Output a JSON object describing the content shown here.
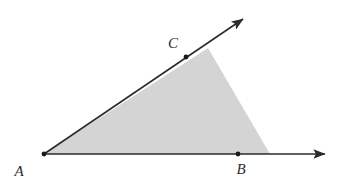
{
  "figure": {
    "canvas": {
      "width": 342,
      "height": 186,
      "background": "#ffffff"
    },
    "style": {
      "stroke_color": "#2b2b2b",
      "stroke_width": 1.6,
      "shade_color": "#d4d4d4",
      "point_color": "#1a1a1a",
      "point_radius": 2.4,
      "label_color": "#2b2b2b",
      "label_font_size": 15
    },
    "labels": {
      "A": "A",
      "B": "B",
      "C": "C"
    },
    "points": [
      {
        "name": "A",
        "label": "A",
        "x": 44,
        "y": 154,
        "role": "vertex",
        "dot": true
      },
      {
        "name": "B",
        "label": "B",
        "x": 238,
        "y": 154,
        "role": "point-on-horizontal-ray",
        "dot": true
      },
      {
        "name": "C",
        "label": "C",
        "x": 186,
        "y": 57,
        "role": "point-on-diagonal-ray",
        "dot": true
      }
    ],
    "label_positions": {
      "A": {
        "x": 19,
        "y": 171
      },
      "B": {
        "x": 241,
        "y": 169
      },
      "C": {
        "x": 173,
        "y": 43
      }
    },
    "rays": [
      {
        "name": "ray-AB",
        "from": "A",
        "through": "B",
        "start": {
          "x": 44,
          "y": 154
        },
        "end": {
          "x": 325,
          "y": 154
        },
        "arrowhead": "end"
      },
      {
        "name": "ray-AC",
        "from": "A",
        "through": "C",
        "start": {
          "x": 44,
          "y": 154
        },
        "end": {
          "x": 243,
          "y": 19
        },
        "arrowhead": "end"
      }
    ],
    "shaded_region": {
      "name": "angle-interior-shading",
      "fill": "#d4d4d4",
      "polygon": [
        {
          "x": 44,
          "y": 154
        },
        {
          "x": 208,
          "y": 48
        },
        {
          "x": 270,
          "y": 154
        }
      ]
    }
  }
}
